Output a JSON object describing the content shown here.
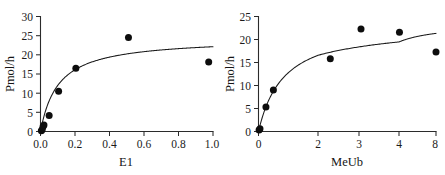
{
  "figure": {
    "background_color": "#ffffff",
    "ink_color": "#1a1a1a",
    "point_color": "#0d0d0d"
  },
  "chart_data": [
    {
      "type": "scatter",
      "panel": "left",
      "title": "",
      "xlabel": "E1",
      "ylabel": "Pmol/h",
      "xlim": [
        0,
        1.0
      ],
      "ylim": [
        0,
        30
      ],
      "xticks": [
        "0.0",
        "0.2",
        "0.4",
        "0.6",
        "0.8",
        "1.0"
      ],
      "xtick_values": [
        0.0,
        0.2,
        0.4,
        0.6,
        0.8,
        1.0
      ],
      "yticks": [
        "0",
        "5",
        "10",
        "15",
        "20",
        "25",
        "30"
      ],
      "ytick_values": [
        0,
        5,
        10,
        15,
        20,
        25,
        30
      ],
      "grid": false,
      "legend": "none",
      "axis_style": "left-and-bottom-spines",
      "series": [
        {
          "name": "observed",
          "marker": "filled-circle",
          "x": [
            0.005,
            0.01,
            0.015,
            0.02,
            0.05,
            0.105,
            0.205,
            0.51,
            0.975
          ],
          "y": [
            0.2,
            0.5,
            1.3,
            1.7,
            4.2,
            10.5,
            16.5,
            24.5,
            18.1
          ]
        },
        {
          "name": "fit",
          "marker": "none",
          "model": "michaelis-menten",
          "vmax": 24.4,
          "km": 0.103
        }
      ]
    },
    {
      "type": "scatter",
      "panel": "right",
      "title": "",
      "xlabel": "MeUb",
      "ylabel": "Pmol/h",
      "xlim": [
        0,
        8
      ],
      "ylim": [
        0,
        25
      ],
      "xticks": [
        "0",
        "2",
        "3",
        "4",
        "8"
      ],
      "xtick_values": [
        0,
        2,
        3,
        4,
        8
      ],
      "xaxis_scale": "compressed-nonlinear",
      "yticks": [
        "0",
        "5",
        "10",
        "15",
        "20",
        "25"
      ],
      "ytick_values": [
        0,
        5,
        10,
        15,
        20,
        25
      ],
      "grid": false,
      "legend": "none",
      "axis_style": "left-and-bottom-spines",
      "series": [
        {
          "name": "observed",
          "marker": "filled-circle",
          "x": [
            0.02,
            0.05,
            0.25,
            0.5,
            2.3,
            3.05,
            4.05,
            8.0
          ],
          "y": [
            0.3,
            0.6,
            5.3,
            9.0,
            15.8,
            22.3,
            21.6,
            17.3
          ]
        },
        {
          "name": "fit",
          "marker": "none",
          "model": "michaelis-menten",
          "vmax": 23.6,
          "km": 0.85
        }
      ]
    }
  ]
}
